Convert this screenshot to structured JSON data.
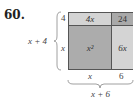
{
  "problem_number": "60.",
  "diagram": {
    "type": "area-model",
    "cells": {
      "top_left": "4x",
      "top_right": "24",
      "bottom_left": "x²",
      "bottom_right": "6x"
    },
    "side_labels": {
      "left_top": "4",
      "left_bottom": "x",
      "bottom_left": "x",
      "bottom_right": "6"
    },
    "brace_labels": {
      "left": "x + 4",
      "bottom": "x + 6"
    },
    "colors": {
      "light": "#d4d4d4",
      "dark": "#acacac",
      "border": "#555555"
    }
  }
}
